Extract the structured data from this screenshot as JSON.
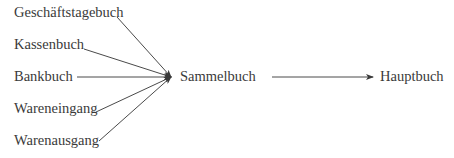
{
  "diagram": {
    "sources": [
      {
        "label": "Geschäftstagebuch"
      },
      {
        "label": "Kassenbuch"
      },
      {
        "label": "Bankbuch"
      },
      {
        "label": "Wareneingang"
      },
      {
        "label": "Warenausgang"
      }
    ],
    "hub": {
      "label": "Sammelbuch"
    },
    "target": {
      "label": "Hauptbuch"
    },
    "colors": {
      "text": "#3a3a3a",
      "line": "#4a4a4a",
      "background": "#ffffff"
    }
  }
}
